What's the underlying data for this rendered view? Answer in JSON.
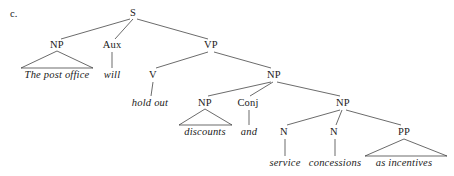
{
  "figure": {
    "item_letter": "c.",
    "kind": "syntax-tree",
    "width": 454,
    "height": 176,
    "background_color": "#ffffff",
    "line_color": "#2b2b2b",
    "text_color": "#1a1a1a",
    "sentence": "The post office will hold out discounts and service concessions as incentives"
  },
  "nodes": [
    {
      "id": "S",
      "label": "S",
      "type": "category",
      "x": 133,
      "y": 13
    },
    {
      "id": "NP1",
      "label": "NP",
      "type": "category",
      "x": 57,
      "y": 45
    },
    {
      "id": "AUX",
      "label": "Aux",
      "type": "category",
      "x": 112,
      "y": 45
    },
    {
      "id": "VP",
      "label": "VP",
      "type": "category",
      "x": 211,
      "y": 45
    },
    {
      "id": "T1",
      "label": "The post office",
      "type": "terminal",
      "x": 57,
      "y": 75
    },
    {
      "id": "T2",
      "label": "will",
      "type": "terminal",
      "x": 112,
      "y": 75
    },
    {
      "id": "V",
      "label": "V",
      "type": "category",
      "x": 153,
      "y": 75
    },
    {
      "id": "NP2",
      "label": "NP",
      "type": "category",
      "x": 274,
      "y": 75
    },
    {
      "id": "T3",
      "label": "hold out",
      "type": "terminal",
      "x": 150,
      "y": 103
    },
    {
      "id": "NP3",
      "label": "NP",
      "type": "category",
      "x": 205,
      "y": 103
    },
    {
      "id": "CONJ",
      "label": "Conj",
      "type": "category",
      "x": 248,
      "y": 103
    },
    {
      "id": "NP4",
      "label": "NP",
      "type": "category",
      "x": 343,
      "y": 103
    },
    {
      "id": "T4",
      "label": "discounts",
      "type": "terminal",
      "x": 205,
      "y": 132
    },
    {
      "id": "T5",
      "label": "and",
      "type": "terminal",
      "x": 249,
      "y": 132
    },
    {
      "id": "N1",
      "label": "N",
      "type": "category",
      "x": 284,
      "y": 132
    },
    {
      "id": "N2",
      "label": "N",
      "type": "category",
      "x": 334,
      "y": 132
    },
    {
      "id": "PP",
      "label": "PP",
      "type": "category",
      "x": 404,
      "y": 132
    },
    {
      "id": "T6",
      "label": "service",
      "type": "terminal",
      "x": 285,
      "y": 163
    },
    {
      "id": "T7",
      "label": "concessions",
      "type": "terminal",
      "x": 335,
      "y": 163
    },
    {
      "id": "T8",
      "label": "as incentives",
      "type": "terminal",
      "x": 404,
      "y": 163
    }
  ],
  "edges": [
    {
      "from": "S",
      "to": "NP1",
      "x1": 130,
      "y1": 19,
      "x2": 61,
      "y2": 39
    },
    {
      "from": "S",
      "to": "AUX",
      "x1": 133,
      "y1": 19,
      "x2": 115,
      "y2": 39
    },
    {
      "from": "S",
      "to": "VP",
      "x1": 137,
      "y1": 19,
      "x2": 208,
      "y2": 39
    },
    {
      "from": "AUX",
      "to": "T2",
      "x1": 112,
      "y1": 52,
      "x2": 112,
      "y2": 68
    },
    {
      "from": "VP",
      "to": "V",
      "x1": 208,
      "y1": 52,
      "x2": 156,
      "y2": 68
    },
    {
      "from": "VP",
      "to": "NP2",
      "x1": 214,
      "y1": 52,
      "x2": 271,
      "y2": 68
    },
    {
      "from": "V",
      "to": "T3",
      "x1": 153,
      "y1": 82,
      "x2": 151,
      "y2": 96
    },
    {
      "from": "NP2",
      "to": "NP3",
      "x1": 271,
      "y1": 82,
      "x2": 208,
      "y2": 96
    },
    {
      "from": "NP2",
      "to": "CONJ",
      "x1": 273,
      "y1": 82,
      "x2": 250,
      "y2": 96
    },
    {
      "from": "NP2",
      "to": "NP4",
      "x1": 277,
      "y1": 82,
      "x2": 340,
      "y2": 96
    },
    {
      "from": "CONJ",
      "to": "T5",
      "x1": 249,
      "y1": 110,
      "x2": 249,
      "y2": 125
    },
    {
      "from": "NP4",
      "to": "N1",
      "x1": 340,
      "y1": 110,
      "x2": 287,
      "y2": 125
    },
    {
      "from": "NP4",
      "to": "N2",
      "x1": 342,
      "y1": 110,
      "x2": 336,
      "y2": 125
    },
    {
      "from": "NP4",
      "to": "PP",
      "x1": 346,
      "y1": 110,
      "x2": 401,
      "y2": 125
    },
    {
      "from": "N1",
      "to": "T6",
      "x1": 285,
      "y1": 139,
      "x2": 285,
      "y2": 156
    },
    {
      "from": "N2",
      "to": "T7",
      "x1": 335,
      "y1": 139,
      "x2": 335,
      "y2": 156
    }
  ],
  "triangles": [
    {
      "parent": "NP1",
      "child": "T1",
      "apex_x": 57,
      "apex_y": 51,
      "left_x": 21,
      "right_x": 93,
      "base_y": 68
    },
    {
      "parent": "NP3",
      "child": "T4",
      "apex_x": 205,
      "apex_y": 109,
      "left_x": 179,
      "right_x": 232,
      "base_y": 125
    },
    {
      "parent": "PP",
      "child": "T8",
      "apex_x": 404,
      "apex_y": 139,
      "left_x": 365,
      "right_x": 447,
      "base_y": 156
    }
  ]
}
